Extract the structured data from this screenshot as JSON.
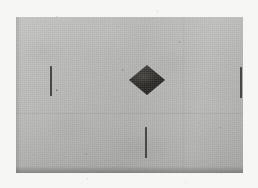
{
  "image": {
    "kind": "scanned-photograph",
    "subject": "dark rhombus specimen with three alignment tick marks on a uniform gray field",
    "width_px": 258,
    "height_px": 188,
    "margin_color": "#f6f6f4",
    "plate": {
      "label": "photographic plate",
      "background_color": "#b9b9b7",
      "left_px": 16,
      "top_px": 17,
      "width_px": 227,
      "height_px": 156,
      "texture": "film-grain"
    },
    "specimen": {
      "label": "dark rhombus specimen",
      "shape": "diamond",
      "fill_color": "#35332f",
      "left_px": 113,
      "top_px": 48,
      "width_px": 36,
      "height_px": 30
    },
    "tick_marks": [
      {
        "label": "left tick mark",
        "name": "tick-left",
        "color": "#4a4845",
        "left_px": 34,
        "top_px": 49,
        "width_px": 2,
        "height_px": 30
      },
      {
        "label": "right tick mark",
        "name": "tick-right",
        "color": "#4a4845",
        "left_px": 224,
        "top_px": 50,
        "width_px": 2,
        "height_px": 31
      },
      {
        "label": "bottom center tick mark",
        "name": "tick-bottom",
        "color": "#4a4845",
        "left_px": 129,
        "top_px": 110,
        "width_px": 2,
        "height_px": 31
      }
    ]
  }
}
